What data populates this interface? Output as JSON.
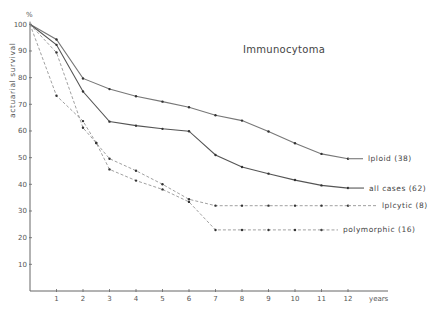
{
  "chart_data": {
    "type": "line",
    "title": "Immunocytoma",
    "xlabel": "years",
    "ylabel": "actuarial survival",
    "yunit": "%",
    "xlim": [
      0,
      13
    ],
    "ylim": [
      0,
      100
    ],
    "x_ticks": [
      "1",
      "2",
      "3",
      "4",
      "5",
      "6",
      "7",
      "8",
      "9",
      "10",
      "11",
      "12"
    ],
    "y_ticks": [
      "10",
      "20",
      "30",
      "40",
      "50",
      "60",
      "70",
      "80",
      "90",
      "100"
    ],
    "grid": false,
    "series": [
      {
        "name": "lploid (38)",
        "style": "solid",
        "color": "#777777",
        "x": [
          0,
          1,
          2,
          3,
          4,
          5,
          6,
          7,
          8,
          9,
          10,
          11,
          12
        ],
        "y": [
          100,
          94.3,
          79.7,
          75.7,
          73.0,
          71.0,
          68.9,
          65.9,
          63.9,
          59.8,
          55.4,
          51.4,
          49.6
        ],
        "label_pos": [
          368,
          158
        ]
      },
      {
        "name": "all cases (62)",
        "style": "solid",
        "color": "#555555",
        "x": [
          0,
          1,
          2,
          3,
          4,
          5,
          6,
          7,
          8,
          9,
          10,
          11,
          12
        ],
        "y": [
          100,
          92.3,
          74.8,
          63.5,
          62.0,
          60.8,
          59.9,
          51.0,
          46.5,
          44.0,
          41.6,
          39.6,
          38.6
        ],
        "label_pos": [
          369,
          188
        ]
      },
      {
        "name": "lplcytic (8)",
        "style": "dashed",
        "color": "#888888",
        "x": [
          0,
          1,
          2,
          2.5,
          3,
          4,
          5,
          6,
          7,
          8,
          9,
          10,
          11,
          12
        ],
        "y": [
          100,
          89.4,
          61.2,
          55.5,
          49.6,
          45.1,
          40.0,
          34.4,
          32.0,
          32.0,
          32.0,
          32.0,
          32.0,
          32.0
        ],
        "label_pos": [
          382,
          209
        ]
      },
      {
        "name": "polymorphic (16)",
        "style": "dashed",
        "color": "#888888",
        "x": [
          0,
          1,
          2,
          2.5,
          3,
          4,
          5,
          6,
          7,
          8,
          9,
          10,
          11
        ],
        "y": [
          100,
          73.2,
          63.7,
          55.5,
          45.6,
          41.4,
          38.1,
          33.4,
          22.9,
          22.9,
          22.9,
          22.9,
          22.9
        ],
        "label_pos": [
          343,
          232
        ]
      }
    ]
  }
}
